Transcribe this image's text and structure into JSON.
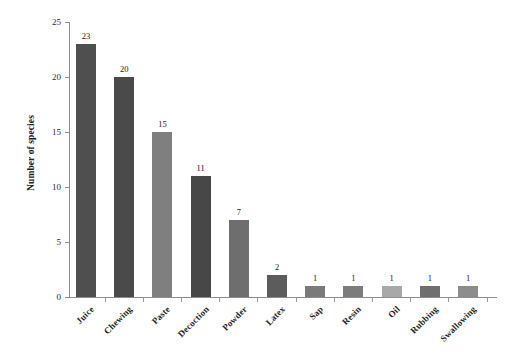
{
  "chart_data": {
    "type": "bar",
    "title": "",
    "subtitle": "",
    "xlabel": "",
    "ylabel": "Number of species",
    "ylim": [
      0,
      25
    ],
    "yticks": [
      0,
      5,
      10,
      15,
      20,
      25
    ],
    "grid": false,
    "legend": "none",
    "categories": [
      "Juice",
      "Chewing",
      "Paste",
      "Decoction",
      "Powder",
      "Latex",
      "Sap",
      "Resin",
      "Oil",
      "Rubbing",
      "Swallowing"
    ],
    "values": [
      23,
      20,
      15,
      11,
      7,
      2,
      1,
      1,
      1,
      1,
      1
    ],
    "value_labels": [
      "23",
      "20",
      "15",
      "11",
      "7",
      "2",
      "1",
      "1",
      "1",
      "1",
      "1"
    ],
    "bar_colors": [
      "#4f4f4f",
      "#4a4a4a",
      "#7f7f7f",
      "#474747",
      "#6e6e6e",
      "#5c5c5c",
      "#7a7a7a",
      "#7c7c7c",
      "#a8a8a8",
      "#6f6f6f",
      "#8c8c8c"
    ],
    "axis_color": "#8d8d8d",
    "background": "#ffffff"
  },
  "axis": {
    "y_tick_labels": [
      "0",
      "5",
      "10",
      "15",
      "20",
      "25"
    ]
  }
}
